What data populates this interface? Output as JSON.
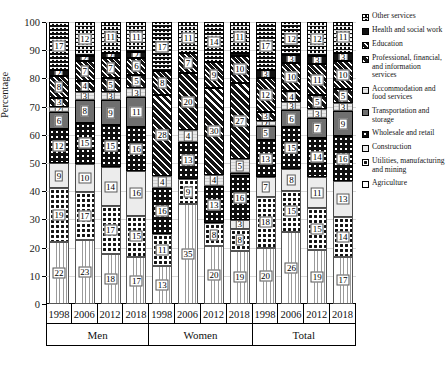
{
  "chart_data": {
    "type": "bar",
    "subtype": "stacked-bar-100-percent",
    "title": "",
    "xlabel": "",
    "ylabel": "Percentage",
    "ylim": [
      0,
      100
    ],
    "yticks": [
      0,
      10,
      20,
      30,
      40,
      50,
      60,
      70,
      80,
      90,
      100
    ],
    "grid": true,
    "legend_position": "right",
    "categories": [
      "1998",
      "2006",
      "2012",
      "2018",
      "1998",
      "2006",
      "2012",
      "2018",
      "1998",
      "2006",
      "2012",
      "2018"
    ],
    "groups": [
      {
        "label": "Men",
        "years": [
          "1998",
          "2006",
          "2012",
          "2018"
        ]
      },
      {
        "label": "Women",
        "years": [
          "1998",
          "2006",
          "2012",
          "2018"
        ]
      },
      {
        "label": "Total",
        "years": [
          "1998",
          "2006",
          "2012",
          "2018"
        ]
      }
    ],
    "series": [
      {
        "name": "Agriculture",
        "key": "agriculture",
        "values": [
          22,
          23,
          18,
          17,
          13,
          35,
          20,
          19,
          20,
          26,
          19,
          17
        ]
      },
      {
        "name": "Utilities, manufacturing and mining",
        "key": "utilities",
        "values": [
          19,
          17,
          17,
          15,
          11,
          9,
          8,
          8,
          18,
          15,
          15,
          14
        ]
      },
      {
        "name": "Construction",
        "key": "construction",
        "values": [
          9,
          10,
          14,
          16,
          0,
          0,
          0,
          3,
          7,
          8,
          11,
          13
        ]
      },
      {
        "name": "Wholesale and retail",
        "key": "wholesale",
        "values": [
          12,
          15,
          15,
          16,
          16,
          13,
          13,
          16,
          13,
          15,
          14,
          16
        ]
      },
      {
        "name": "Transportation and storage",
        "key": "transport",
        "values": [
          6,
          8,
          9,
          11,
          0,
          0,
          0,
          1,
          5,
          6,
          7,
          9
        ]
      },
      {
        "name": "Accommodation and food services",
        "key": "accommodation",
        "values": [
          2,
          3,
          3,
          3,
          4,
          4,
          4,
          5,
          2,
          3,
          3,
          3
        ]
      },
      {
        "name": "Professional, financial, and information services",
        "key": "professional",
        "values": [
          3,
          4,
          5,
          5,
          28,
          20,
          30,
          27,
          3,
          4,
          5,
          5
        ]
      },
      {
        "name": "Education",
        "key": "education",
        "values": [
          8,
          7,
          7,
          6,
          8,
          7,
          9,
          10,
          12,
          10,
          11,
          10
        ]
      },
      {
        "name": "Health and social work",
        "key": "health",
        "values": [
          2,
          2,
          2,
          2,
          0,
          0,
          0,
          1,
          3,
          3,
          3,
          3
        ]
      },
      {
        "name": "Other services",
        "key": "other",
        "values": [
          17,
          12,
          11,
          11,
          17,
          11,
          14,
          11,
          17,
          12,
          12,
          11
        ]
      }
    ],
    "legend_order": [
      "Other services",
      "Health and social work",
      "Education",
      "Professional, financial, and information services",
      "Accommodation and food services",
      "Transportation and storage",
      "Wholesale and retail",
      "Construction",
      "Utilities, manufacturing and mining",
      "Agriculture"
    ],
    "legend_keys": [
      "other",
      "health",
      "education",
      "professional",
      "accommodation",
      "transport",
      "wholesale",
      "construction",
      "utilities",
      "agriculture"
    ]
  }
}
